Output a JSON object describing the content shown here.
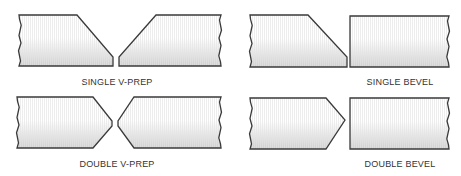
{
  "diagram": {
    "colors": {
      "outline": "#3a3a3a",
      "shade_dark": "#cfcfcf",
      "shade_light": "#ffffff",
      "text": "#333333"
    },
    "panels": [
      {
        "id": "single-v-prep",
        "label": "SINGLE V-PREP",
        "label_pos": [
          117,
          85
        ],
        "pieces": [
          {
            "name": "left-plate",
            "points": "19,15 77,15 113,57 113,66 19,66",
            "wavy_side": "left"
          },
          {
            "name": "right-plate",
            "points": "156,15 221,15 221,66 119,66 119,57",
            "wavy_side": "right"
          }
        ]
      },
      {
        "id": "single-bevel",
        "label": "SINGLE BEVEL",
        "label_pos": [
          400,
          85
        ],
        "pieces": [
          {
            "name": "left-plate",
            "points": "250,15 308,15 347,57 347,67 250,67",
            "wavy_side": "left"
          },
          {
            "name": "right-plate",
            "points": "350,16 449,16 449,67 350,67",
            "wavy_side": "right"
          }
        ]
      },
      {
        "id": "double-v-prep",
        "label": "DOUBLE V-PREP",
        "label_pos": [
          117,
          167
        ],
        "pieces": [
          {
            "name": "left-plate",
            "points": "17,97 93,97 112,121 112,126 93,148 17,148",
            "wavy_side": "left"
          },
          {
            "name": "right-plate",
            "points": "134,97 221,97 221,148 134,148 118,126 118,121",
            "wavy_side": "right"
          }
        ]
      },
      {
        "id": "double-bevel",
        "label": "DOUBLE BEVEL",
        "label_pos": [
          400,
          167
        ],
        "pieces": [
          {
            "name": "left-plate",
            "points": "250,98 326,98 345,120 326,149 250,149",
            "wavy_side": "left"
          },
          {
            "name": "right-plate",
            "points": "350,98 449,98 449,149 350,149",
            "wavy_side": "right"
          }
        ]
      }
    ]
  }
}
